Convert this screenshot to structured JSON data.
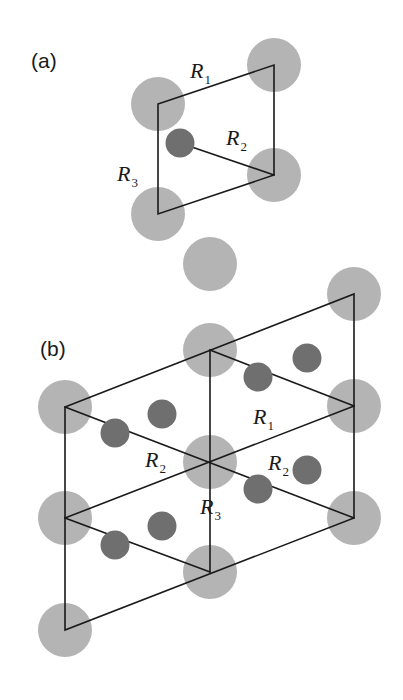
{
  "figure": {
    "width": 403,
    "height": 700,
    "background_color": "#ffffff"
  },
  "colors": {
    "large_atom": "#b4b4b4",
    "small_atom": "#6f6f6f",
    "line": "#1a1a1a",
    "text": "#1a1a1a"
  },
  "atom_radii": {
    "large": 27,
    "small": 14.5
  },
  "line_width": 1.6,
  "panels": [
    {
      "id": "panel-a",
      "tag": "(a)",
      "tag_pos": {
        "x": 31,
        "y": 68
      },
      "cell_outline": [
        {
          "x": 158,
          "y": 104
        },
        {
          "x": 274,
          "y": 65
        },
        {
          "x": 274,
          "y": 175
        },
        {
          "x": 158,
          "y": 214
        }
      ],
      "inner_segments": [
        {
          "x1": 180,
          "y1": 143,
          "x2": 274,
          "y2": 175
        }
      ],
      "large_atoms": [
        {
          "x": 158,
          "y": 104
        },
        {
          "x": 274,
          "y": 65
        },
        {
          "x": 274,
          "y": 175
        },
        {
          "x": 158,
          "y": 214
        }
      ],
      "small_atoms": [
        {
          "x": 180,
          "y": 143
        }
      ],
      "labels": [
        {
          "text": "R",
          "sub": "1",
          "x": 190,
          "y": 78
        },
        {
          "text": "R",
          "sub": "2",
          "x": 226,
          "y": 145
        },
        {
          "text": "R",
          "sub": "3",
          "x": 117,
          "y": 181
        }
      ]
    },
    {
      "id": "panel-b",
      "tag": "(b)",
      "tag_pos": {
        "x": 40,
        "y": 356
      },
      "cell_outline": [
        {
          "x": 65,
          "y": 407
        },
        {
          "x": 354,
          "y": 294
        },
        {
          "x": 354,
          "y": 518
        },
        {
          "x": 65,
          "y": 630
        }
      ],
      "inner_segments": [
        {
          "x1": 210,
          "y1": 350,
          "x2": 210,
          "y2": 572
        },
        {
          "x1": 65,
          "y1": 518,
          "x2": 354,
          "y2": 406
        },
        {
          "x1": 65,
          "y1": 407,
          "x2": 354,
          "y2": 518
        },
        {
          "x1": 210,
          "y1": 350,
          "x2": 354,
          "y2": 406
        },
        {
          "x1": 65,
          "y1": 518,
          "x2": 210,
          "y2": 572
        }
      ],
      "large_atoms": [
        {
          "x": 210,
          "y": 350
        },
        {
          "x": 210,
          "y": 462
        },
        {
          "x": 210,
          "y": 572
        },
        {
          "x": 65,
          "y": 407
        },
        {
          "x": 65,
          "y": 518
        },
        {
          "x": 65,
          "y": 630
        },
        {
          "x": 354,
          "y": 294
        },
        {
          "x": 354,
          "y": 406
        },
        {
          "x": 354,
          "y": 518
        },
        {
          "x": 210,
          "y": 264
        }
      ],
      "small_atoms": [
        {
          "x": 258,
          "y": 377
        },
        {
          "x": 307,
          "y": 358
        },
        {
          "x": 115,
          "y": 433
        },
        {
          "x": 162,
          "y": 414
        },
        {
          "x": 258,
          "y": 489
        },
        {
          "x": 307,
          "y": 470
        },
        {
          "x": 115,
          "y": 545
        },
        {
          "x": 162,
          "y": 526
        }
      ],
      "labels": [
        {
          "text": "R",
          "sub": "1",
          "x": 253,
          "y": 424
        },
        {
          "text": "R",
          "sub": "2",
          "x": 145,
          "y": 467
        },
        {
          "text": "R",
          "sub": "2",
          "x": 268,
          "y": 470
        },
        {
          "text": "R",
          "sub": "3",
          "x": 200,
          "y": 514
        }
      ]
    }
  ]
}
